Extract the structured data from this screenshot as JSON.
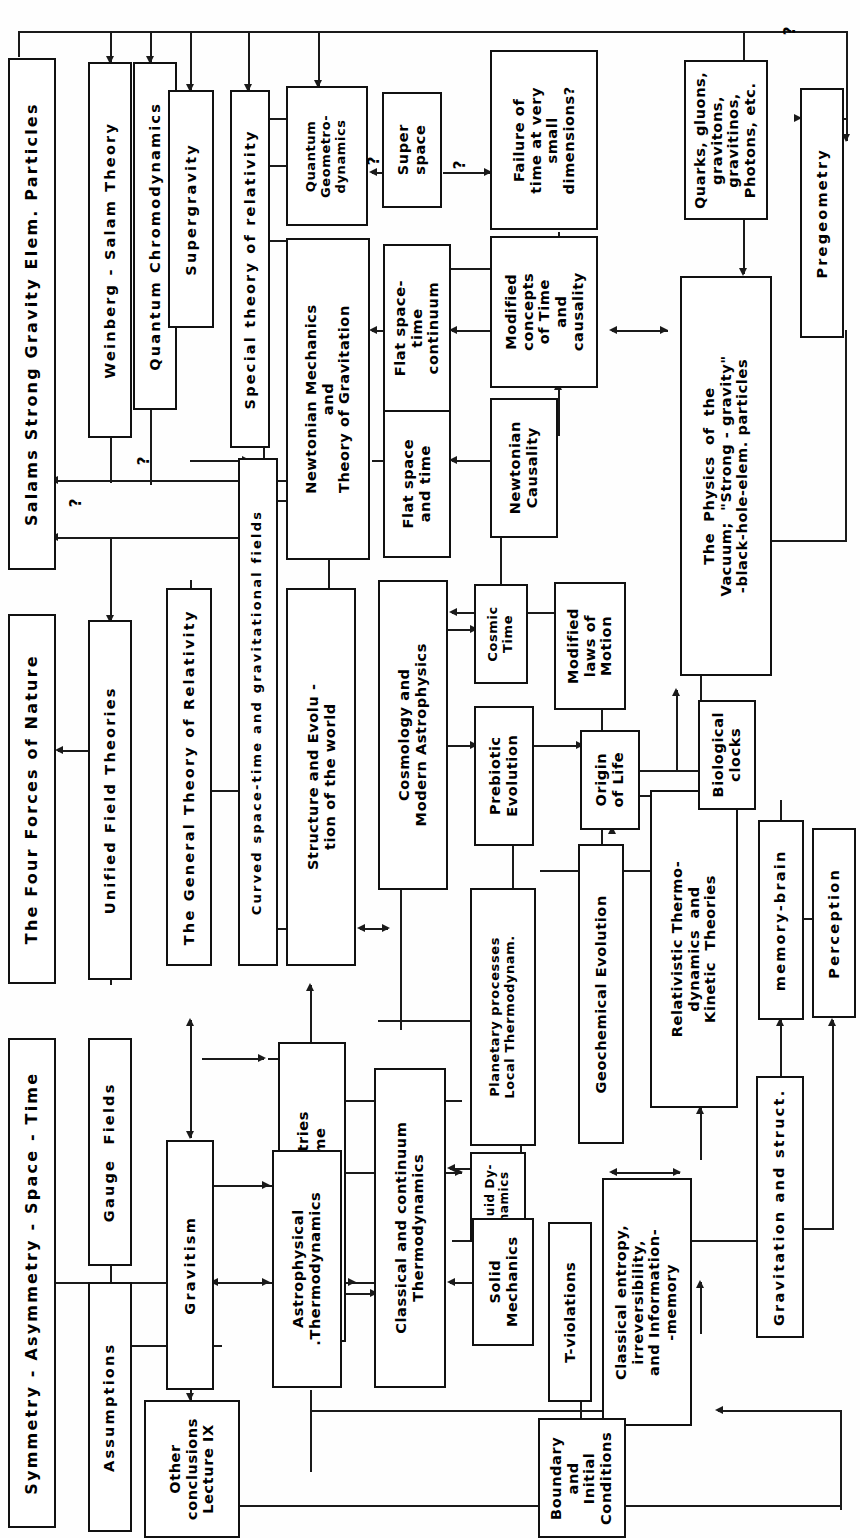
{
  "diagram": {
    "title": "Symmetry - Asymmetry - Space - Time",
    "orientation": "text rotated 90 degrees counter-clockwise",
    "lecture_label": "Lecture IX",
    "nodes": [
      {
        "id": "symmetry",
        "label": "Symmetry - Asymmetry - Space - Time"
      },
      {
        "id": "four_forces",
        "label": "The Four Forces of Nature"
      },
      {
        "id": "salams",
        "label": "Salams Strong Gravity Elem. Particles"
      },
      {
        "id": "assumptions",
        "label": "Assumptions"
      },
      {
        "id": "gauge_fields",
        "label": "Gauge  Fields"
      },
      {
        "id": "unified_field",
        "label": "Unified Field Theories"
      },
      {
        "id": "weinberg_salam",
        "label": "Weinberg - Salam Theory"
      },
      {
        "id": "qcd",
        "label": "Quantum Chromodynamics"
      },
      {
        "id": "supergravity",
        "label": "Supergravity"
      },
      {
        "id": "other_concl",
        "label": "Other\nconclusions\nLecture IX"
      },
      {
        "id": "gravitism",
        "label": "Gravitism"
      },
      {
        "id": "general_rel",
        "label": "The General Theory of Relativity"
      },
      {
        "id": "curved_st",
        "label": "Curved space-time and gravitational fields"
      },
      {
        "id": "special_rel",
        "label": "Special theory of relativity"
      },
      {
        "id": "quantum_geom",
        "label": "Quantum\nGeometro-\ndynamics"
      },
      {
        "id": "superspace",
        "label": "Super\nspace"
      },
      {
        "id": "failure_time",
        "label": "Failure of\ntime at very\nsmall\ndimensions?"
      },
      {
        "id": "newtonian_mech",
        "label": "Newtonian Mechanics\nand\nTheory of Gravitation"
      },
      {
        "id": "flat_st_cont",
        "label": "Flat space-\ntime\ncontinuum"
      },
      {
        "id": "flat_space_time",
        "label": "Flat space\nand time"
      },
      {
        "id": "modified_time",
        "label": "Modified\nconcepts\nof Time\nand\ncausality"
      },
      {
        "id": "newtonian_caus",
        "label": "Newtonian\nCausality"
      },
      {
        "id": "structure_evol",
        "label": "Structure and Evolu -\ntion of the world"
      },
      {
        "id": "cosmology",
        "label": "Cosmology and\nModern Astrophysics"
      },
      {
        "id": "cosmic_time",
        "label": "Cosmic\nTime"
      },
      {
        "id": "modified_laws",
        "label": "Modified\nlaws of\nMotion"
      },
      {
        "id": "time_asym",
        "label": "Time Asymmetries\nTheory of time"
      },
      {
        "id": "prebiotic",
        "label": "Prebiotic\nEvolution"
      },
      {
        "id": "origin_life",
        "label": "Origin\nof Life"
      },
      {
        "id": "astrophys_thermo",
        "label": "Astrophysical\n.Thermodynamics"
      },
      {
        "id": "classical_cont",
        "label": "Classical and continuum\nThermodynamics"
      },
      {
        "id": "planetary",
        "label": "Planetary processes\nLocal Thermodynam."
      },
      {
        "id": "fluid_dyn",
        "label": "Fluid Dy-\nnamics"
      },
      {
        "id": "solid_mech",
        "label": "Solid\nMechanics"
      },
      {
        "id": "t_violations",
        "label": "T-violations"
      },
      {
        "id": "geochemical",
        "label": "Geochemical Evolution"
      },
      {
        "id": "classical_entropy",
        "label": "Classical entropy,\nirreversibility,\nand Information-\n-memory"
      },
      {
        "id": "rel_thermo",
        "label": "Relativistic Thermo-\ndynamics  and\nKinetic  Theories"
      },
      {
        "id": "boundary",
        "label": "Boundary\nand\nInitial\nConditions"
      },
      {
        "id": "physics_vacuum",
        "label": "The  Physics  of  the\nVacuum;  \"Strong - gravity\"\n-black-hole-elem. particles"
      },
      {
        "id": "quarks",
        "label": "Quarks, gluons,\ngravitons,\ngravitinos,\nPhotons, etc."
      },
      {
        "id": "pregeometry",
        "label": "Pregeometry"
      },
      {
        "id": "biological",
        "label": "Biological\nclocks"
      },
      {
        "id": "memory_brain",
        "label": "memory-brain"
      },
      {
        "id": "perception",
        "label": "Perception"
      },
      {
        "id": "gravitation_struct",
        "label": "Gravitation and struct."
      }
    ],
    "question_marks": [
      {
        "id": "q-salams-left",
        "text": "?"
      },
      {
        "id": "q-qcd",
        "text": "?"
      },
      {
        "id": "q-quantum-geom",
        "text": "?"
      },
      {
        "id": "q-superspace",
        "text": "?"
      },
      {
        "id": "q-pregeometry",
        "text": "?"
      }
    ],
    "colors": {
      "stroke": "#111111",
      "background": "#ffffff",
      "text": "#000000"
    }
  }
}
